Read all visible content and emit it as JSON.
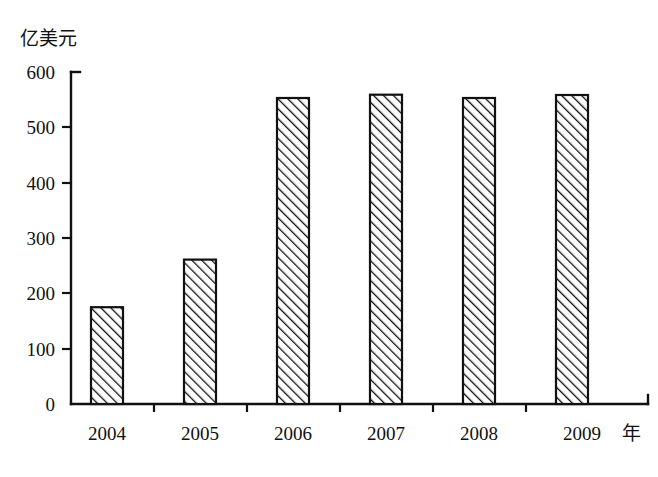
{
  "chart_data": {
    "type": "bar",
    "title": "",
    "subtitle": "",
    "xlabel": "年",
    "ylabel": "亿美元",
    "categories": [
      "2004",
      "2005",
      "2006",
      "2007",
      "2008",
      "2009"
    ],
    "values": [
      55,
      122,
      175,
      261,
      553,
      559
    ],
    "series": [
      {
        "name": "",
        "values": [
          55,
          122,
          175,
          261,
          553,
          559
        ]
      }
    ],
    "ylim": [
      0,
      600
    ],
    "y_ticks": [
      "0",
      "100",
      "200",
      "300",
      "400",
      "500",
      "600"
    ],
    "y_tick_values": [
      0,
      100,
      200,
      300,
      400,
      500,
      600
    ],
    "grid": false,
    "legend": "none",
    "bar_fill": "diagonal-hatch",
    "colors": {
      "axis": "#111111",
      "bar_outline": "#111111",
      "bar_fill": "#ffffff",
      "hatch": "#111111",
      "background": "#ffffff"
    },
    "annotations": []
  },
  "axes": {
    "y_axis_unit_label": "亿美元",
    "x_axis_unit_label": "年"
  }
}
